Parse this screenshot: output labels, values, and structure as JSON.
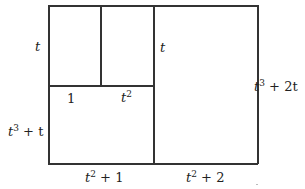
{
  "diagram": {
    "type": "area-model-rectangle",
    "outer_rect": {
      "x": 48,
      "y": 5,
      "w": 210,
      "h": 159
    },
    "labels": {
      "left_top": "t",
      "left_bottom_base": "t",
      "left_bottom_exp": "3",
      "left_bottom_rest": " + t",
      "inner_1": "1",
      "inner_t2_base": "t",
      "inner_t2_exp": "2",
      "middle_t": "t",
      "right_base": "t",
      "right_exp": "3",
      "right_rest": " + 2t",
      "bottom_left_base": "t",
      "bottom_left_exp": "2",
      "bottom_left_rest": " + 1",
      "bottom_right_base": "t",
      "bottom_right_exp": "2",
      "bottom_right_rest": " + 2"
    },
    "line_color": "#333333"
  }
}
